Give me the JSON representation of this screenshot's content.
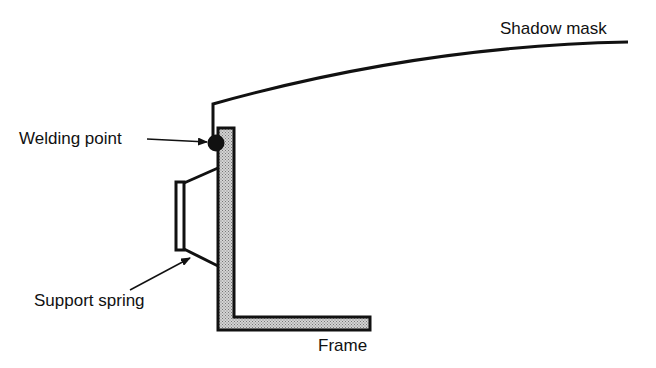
{
  "diagram": {
    "type": "cross-section",
    "labels": {
      "shadow_mask": "Shadow mask",
      "welding_point": "Welding point",
      "support_spring": "Support spring",
      "frame": "Frame"
    },
    "colors": {
      "line": "#111111",
      "frame_fill": "#b0b0b0",
      "background": "#ffffff"
    }
  }
}
